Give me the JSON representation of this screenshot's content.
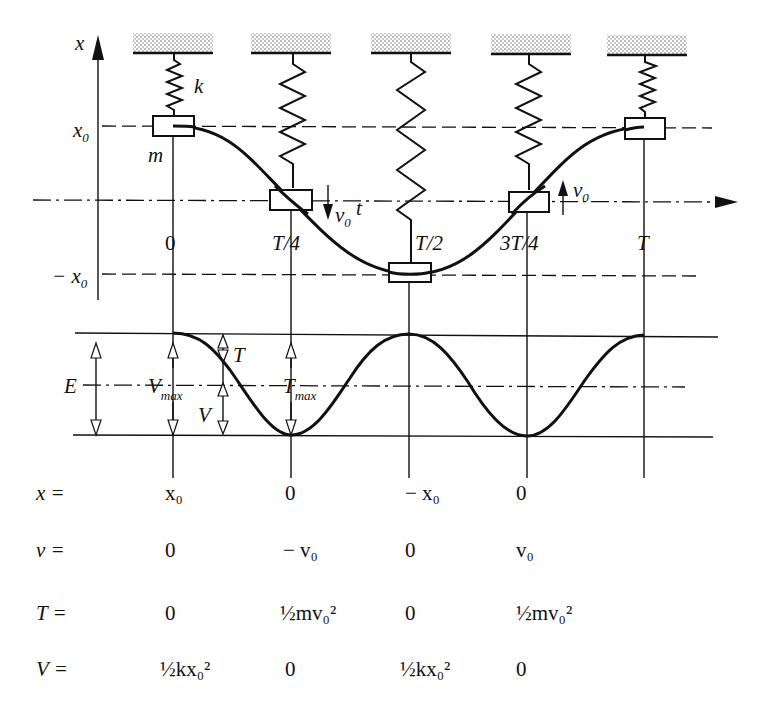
{
  "diagram": {
    "axes": {
      "displacement_axis_label": "x",
      "time_axis_label": "t",
      "upper_level_label": "x",
      "upper_level_sub": "0",
      "lower_level_label": "− x",
      "lower_level_sub": "0"
    },
    "spring_label": "k",
    "mass_label": "m",
    "time_ticks": [
      {
        "label": "0"
      },
      {
        "label": "T/4"
      },
      {
        "label": "T/2"
      },
      {
        "label": "3T/4"
      },
      {
        "label": "T"
      }
    ],
    "velocity_arrows": [
      {
        "at": "T/4",
        "direction": "down",
        "label": "v",
        "sub": "0"
      },
      {
        "at": "3T/4",
        "direction": "up",
        "label": "v",
        "sub": "0"
      }
    ],
    "energy_graph": {
      "total_label": "E",
      "vmax_label": "V",
      "vmax_sub": "max",
      "tmax_label": "T",
      "tmax_sub": "max",
      "kinetic_label": "T",
      "potential_label": "V"
    },
    "table": {
      "rows": [
        {
          "label": "x =",
          "values": [
            "x₀",
            "0",
            "− x₀",
            "0"
          ]
        },
        {
          "label": "v =",
          "values": [
            "0",
            "− v₀",
            "0",
            "v₀"
          ]
        },
        {
          "label": "T =",
          "values": [
            "0",
            "½mv₀²",
            "0",
            "½mv₀²"
          ]
        },
        {
          "label": "V =",
          "values": [
            "½kx₀²",
            "0",
            "½kx₀²",
            "0"
          ]
        }
      ]
    }
  }
}
